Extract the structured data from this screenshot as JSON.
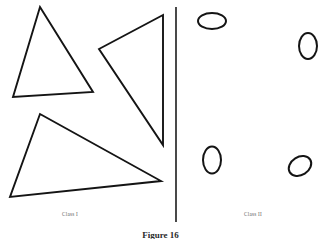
{
  "figure": {
    "caption": "Figure 16",
    "background_color": "#ffffff",
    "ink_color": "#141414",
    "label_color": "#5d5d5d"
  },
  "classes": {
    "left": {
      "label": "Class I",
      "shape_kind": "triangle",
      "count": 3
    },
    "right": {
      "label": "Class II",
      "shape_kind": "ellipse",
      "count": 4
    }
  },
  "divider": {
    "x": 176,
    "y_top": 7,
    "y_bottom": 222,
    "color": "#2a2a2a"
  },
  "triangles": [
    {
      "name": "triangle-upper-left",
      "points": "40,7 93,92 13,97"
    },
    {
      "name": "triangle-middle",
      "points": "163,15 99,49 163,145"
    },
    {
      "name": "triangle-lower-left",
      "points": "40,114 161,181 10,197"
    }
  ],
  "ellipses": [
    {
      "name": "ellipse-top-left",
      "cx": 212,
      "cy": 21,
      "rx": 14,
      "ry": 8,
      "rotation": 0
    },
    {
      "name": "ellipse-top-right",
      "cx": 308,
      "cy": 46,
      "rx": 9,
      "ry": 13,
      "rotation": 0
    },
    {
      "name": "ellipse-bottom-left",
      "cx": 212,
      "cy": 160,
      "rx": 9,
      "ry": 13.5,
      "rotation": 0
    },
    {
      "name": "ellipse-bottom-right",
      "cx": 300,
      "cy": 166,
      "rx": 12,
      "ry": 9,
      "rotation": -32
    }
  ]
}
